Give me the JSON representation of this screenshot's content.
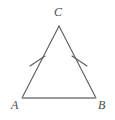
{
  "figure": {
    "kind": "isosceles-triangle-diagram",
    "background_color": "#ffffff",
    "leg_color": "#5a5a5a",
    "base_color": "#9a9a9a",
    "tick_color": "#5a5a5a",
    "label_color": "#4a4a4a",
    "leg_stroke_width": 1.1,
    "base_stroke_width": 2.0,
    "tick_stroke_width": 1.1,
    "vertices": [
      {
        "name": "C",
        "label": "C",
        "x": 59,
        "y": 26,
        "label_x": 54,
        "label_y": 6
      },
      {
        "name": "A",
        "label": "A",
        "x": 22,
        "y": 98,
        "label_x": 11,
        "label_y": 99
      },
      {
        "name": "B",
        "label": "B",
        "x": 96,
        "y": 98,
        "label_x": 98,
        "label_y": 99
      }
    ],
    "sides": [
      {
        "name": "side-CA",
        "from": "C",
        "to": "A",
        "x1": 59,
        "y1": 26,
        "x2": 22,
        "y2": 98,
        "ticks": 1
      },
      {
        "name": "side-CB",
        "from": "C",
        "to": "B",
        "x1": 59,
        "y1": 26,
        "x2": 96,
        "y2": 98,
        "ticks": 1
      },
      {
        "name": "side-AB",
        "from": "A",
        "to": "B",
        "x1": 22,
        "y1": 98,
        "x2": 96,
        "y2": 98,
        "ticks": 0
      }
    ],
    "tick_marks": [
      {
        "name": "tick-mark-left",
        "on_side": "side-CA",
        "x1": 30,
        "y1": 66,
        "x2": 45,
        "y2": 56
      },
      {
        "name": "tick-mark-right",
        "on_side": "side-CB",
        "x1": 72,
        "y1": 56,
        "x2": 87,
        "y2": 66
      }
    ]
  }
}
